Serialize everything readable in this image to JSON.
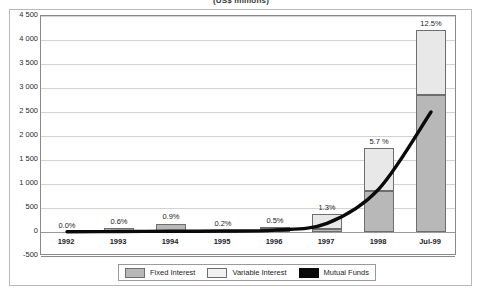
{
  "chart_data": {
    "type": "bar",
    "title": "(US$ millions)",
    "xlabel": "",
    "ylabel": "",
    "ylim": [
      -500,
      4500
    ],
    "yticks": [
      "4 500",
      "4 000",
      "3 500",
      "3 000",
      "2 500",
      "2 000",
      "1 500",
      "1 000",
      "500",
      "0",
      "-500"
    ],
    "ytick_values": [
      4500,
      4000,
      3500,
      3000,
      2500,
      2000,
      1500,
      1000,
      500,
      0,
      -500
    ],
    "grid": true,
    "legend_position": "bottom",
    "categories": [
      "1992",
      "1993",
      "1994",
      "1995",
      "1996",
      "1997",
      "1998",
      "Jul-99"
    ],
    "series": [
      {
        "name": "Fixed Interest",
        "type": "bar-stacked",
        "color": "#b8b8b8",
        "values": [
          5,
          80,
          175,
          30,
          55,
          60,
          860,
          2850
        ]
      },
      {
        "name": "Variable Interest",
        "type": "bar-stacked",
        "color": "#e8e8e8",
        "values": [
          0,
          5,
          10,
          5,
          45,
          310,
          880,
          1350
        ]
      },
      {
        "name": "Mutual Funds",
        "type": "line",
        "color": "#0a0a0a",
        "values": [
          5,
          10,
          15,
          20,
          40,
          180,
          900,
          2500
        ]
      }
    ],
    "data_labels": [
      "0.0%",
      "0.6%",
      "0.9%",
      "0.2%",
      "0.5%",
      "1.3%",
      "5.7 %",
      "12.5%"
    ],
    "totals": [
      5,
      85,
      185,
      35,
      100,
      370,
      1740,
      4200
    ]
  },
  "legend": {
    "items": [
      {
        "label": "Fixed Interest",
        "swatch": "fixed"
      },
      {
        "label": "Variable Interest",
        "swatch": "variable"
      },
      {
        "label": "Mutual Funds",
        "swatch": "mutual"
      }
    ]
  }
}
